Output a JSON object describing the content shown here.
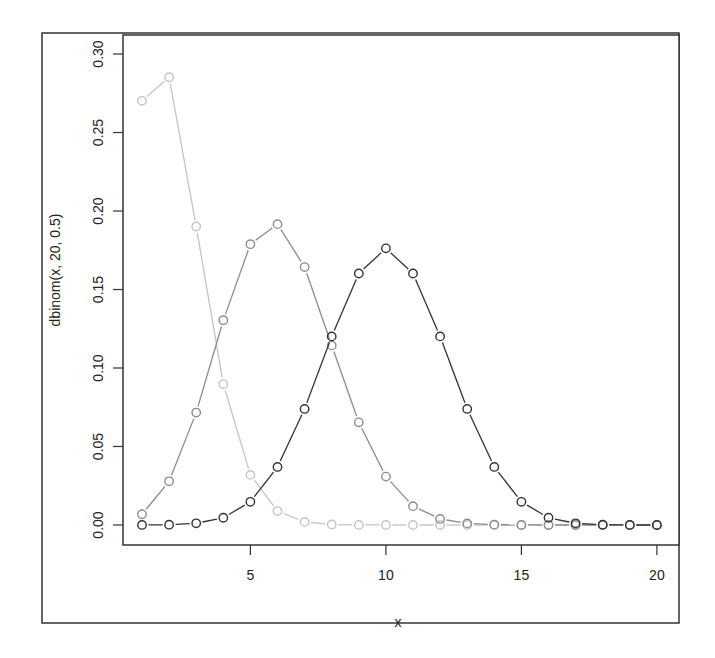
{
  "chart_data": {
    "type": "line",
    "title": "",
    "xlabel": "x",
    "ylabel": "dbinom(x, 20, 0.5)",
    "x": [
      1,
      2,
      3,
      4,
      5,
      6,
      7,
      8,
      9,
      10,
      11,
      12,
      13,
      14,
      15,
      16,
      17,
      18,
      19,
      20
    ],
    "xlim": [
      0.3,
      20.8
    ],
    "ylim": [
      -0.012,
      0.31
    ],
    "x_ticks": [
      5,
      10,
      15,
      20
    ],
    "x_tick_labels": [
      "5",
      "10",
      "15",
      "20"
    ],
    "y_ticks": [
      0.0,
      0.05,
      0.1,
      0.15,
      0.2,
      0.25,
      0.3
    ],
    "y_tick_labels": [
      "0.00",
      "0.05",
      "0.10",
      "0.15",
      "0.20",
      "0.25",
      "0.30"
    ],
    "grid": false,
    "legend": null,
    "markers": "open-circle",
    "series": [
      {
        "name": "dbinom(x, 20, 0.5)",
        "color": "#333333",
        "values": [
          1.91e-05,
          0.000181,
          0.001087,
          0.004621,
          0.014786,
          0.036964,
          0.073929,
          0.120134,
          0.160179,
          0.176197,
          0.160179,
          0.120134,
          0.073929,
          0.036964,
          0.014786,
          0.004621,
          0.001087,
          0.000181,
          1.91e-05,
          9.5e-07
        ]
      },
      {
        "name": "dbinom(x, 20, 0.3)",
        "color": "#8c8c8c",
        "values": [
          0.006839,
          0.027846,
          0.071604,
          0.130421,
          0.178863,
          0.191639,
          0.164262,
          0.114397,
          0.06537,
          0.030817,
          0.012007,
          0.003859,
          0.001018,
          0.000218,
          3.74e-05,
          5e-06,
          5e-07,
          0.0,
          0.0,
          0.0
        ]
      },
      {
        "name": "dbinom(x, 20, 0.1)",
        "color": "#c4c4c4",
        "values": [
          0.27017,
          0.28518,
          0.19012,
          0.089779,
          0.031921,
          0.008867,
          0.00197,
          0.000356,
          5.27e-05,
          6.4e-06,
          6e-07,
          0.0,
          0.0,
          0.0,
          0.0,
          0.0,
          0.0,
          0.0,
          0.0,
          0.0
        ]
      }
    ]
  },
  "layout": {
    "outer_frame": {
      "left": 42,
      "top": 33,
      "right": 679,
      "bottom": 623
    },
    "plot_box": {
      "left": 123,
      "top": 35,
      "right": 679,
      "bottom": 545
    },
    "x_map": {
      "x1": 142,
      "unit_px": 27.1
    },
    "y_map": {
      "y0_px": 525,
      "y030_px": 54
    }
  }
}
